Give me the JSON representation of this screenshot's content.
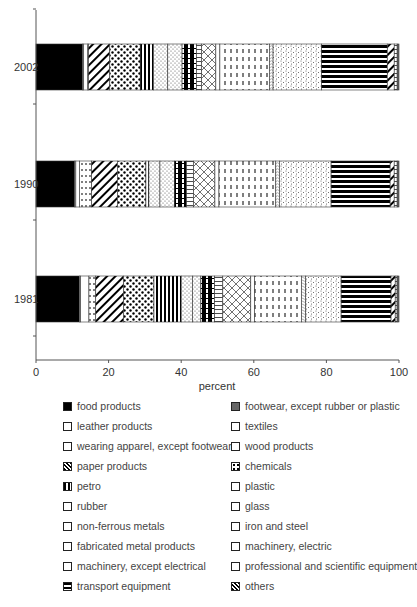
{
  "chart_data": {
    "type": "bar",
    "orientation": "horizontal",
    "stacked": true,
    "title": "",
    "xlabel": "percent",
    "ylabel": "",
    "xlim": [
      0,
      100
    ],
    "x_ticks": [
      "0",
      "20",
      "40",
      "60",
      "80",
      "100"
    ],
    "categories": [
      "2002",
      "1990",
      "1981"
    ],
    "series": [
      {
        "name": "food products",
        "values": [
          12.7,
          10.5,
          11.5
        ]
      },
      {
        "name": "leather products",
        "values": [
          0.3,
          0.3,
          0.3
        ]
      },
      {
        "name": "wearing apparel, except footwear",
        "values": [
          0.8,
          0.8,
          0.5
        ]
      },
      {
        "name": "paper products",
        "values": [
          5.8,
          7.0,
          7.4
        ]
      },
      {
        "name": "petro",
        "values": [
          3.6,
          0.8,
          7.2
        ]
      },
      {
        "name": "rubber",
        "values": [
          3.9,
          3.9,
          2.2
        ]
      },
      {
        "name": "non-ferrous metals",
        "values": [
          1.4,
          1.9,
          2.2
        ]
      },
      {
        "name": "fabricated metal products",
        "values": [
          1.1,
          1.1,
          1.0
        ]
      },
      {
        "name": "machinery, except electrical",
        "values": [
          1.0,
          1.0,
          1.1
        ]
      },
      {
        "name": "transport equipment",
        "values": [
          17.9,
          16.0,
          13.2
        ]
      },
      {
        "name": "footwear, except rubber or plastic",
        "values": [
          0.5,
          0.5,
          0.5
        ]
      },
      {
        "name": "textiles",
        "values": [
          1.0,
          1.0,
          2.2
        ]
      },
      {
        "name": "wood products",
        "values": [
          0.3,
          3.3,
          1.8
        ]
      },
      {
        "name": "chemicals",
        "values": [
          8.3,
          7.7,
          8.0
        ]
      },
      {
        "name": "plastic",
        "values": [
          3.9,
          3.0,
          3.0
        ]
      },
      {
        "name": "glass",
        "values": [
          3.9,
          3.3,
          3.6
        ]
      },
      {
        "name": "iron and steel",
        "values": [
          3.9,
          5.8,
          7.4
        ]
      },
      {
        "name": "machinery, electric",
        "values": [
          13.5,
          15.4,
          12.4
        ]
      },
      {
        "name": "professional and scientific equipment",
        "values": [
          13.2,
          14.0,
          9.4
        ]
      },
      {
        "name": "others",
        "values": [
          1.9,
          1.1,
          1.1
        ]
      }
    ],
    "legend_position": "bottom",
    "grid": false
  },
  "chart": {
    "xlabel": "percent",
    "ticks": [
      "0",
      "20",
      "40",
      "60",
      "80",
      "100"
    ],
    "years": [
      "2002",
      "1990",
      "1981"
    ]
  },
  "legend": {
    "left": [
      "food products",
      "leather products",
      "wearing apparel, except footwear",
      "paper products",
      "petro",
      "rubber",
      "non-ferrous metals",
      "fabricated metal products",
      "machinery, except electrical",
      "transport equipment"
    ],
    "right": [
      "footwear, except rubber or plastic",
      "textiles",
      "wood products",
      "chemicals",
      "plastic",
      "glass",
      "iron and steel",
      "machinery, electric",
      "professional and scientific equipment",
      "others"
    ]
  }
}
